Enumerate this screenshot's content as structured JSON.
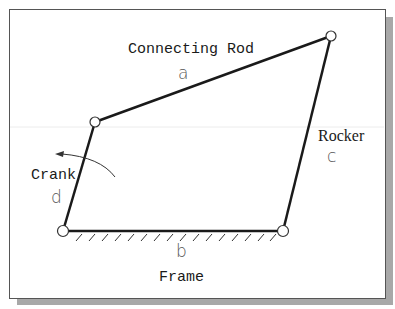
{
  "diagram": {
    "links": [
      {
        "id": "a",
        "name": "Connecting Rod",
        "letter": "a"
      },
      {
        "id": "b",
        "name": "Frame",
        "letter": "b"
      },
      {
        "id": "c",
        "name": "Rocker",
        "letter": "c"
      },
      {
        "id": "d",
        "name": "Crank",
        "letter": "d"
      }
    ],
    "labels": {
      "connecting_rod": "Connecting Rod",
      "connecting_rod_letter": "a",
      "frame": "Frame",
      "frame_letter": "b",
      "rocker": "Rocker",
      "rocker_letter": "c",
      "crank": "Crank",
      "crank_letter": "d"
    },
    "joints": [
      {
        "name": "crank-coupler-joint",
        "x": 95,
        "y": 122
      },
      {
        "name": "coupler-rocker-joint",
        "x": 331,
        "y": 36
      },
      {
        "name": "frame-crank-pivot",
        "x": 63,
        "y": 231
      },
      {
        "name": "frame-rocker-pivot",
        "x": 283,
        "y": 231
      }
    ],
    "rotation_arrow": "counterclockwise",
    "colors": {
      "link": "#1a1a1a",
      "frame_border": "#555555",
      "shadow": "#a8a8a8",
      "letter": "#555555"
    }
  }
}
